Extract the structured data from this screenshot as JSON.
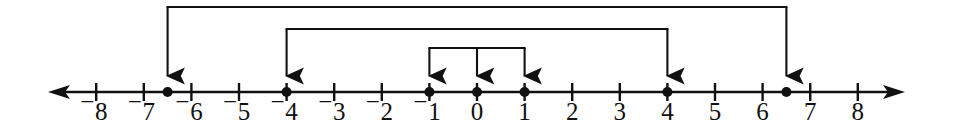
{
  "figure": {
    "background_color": "#ffffff",
    "ink_color": "#111111"
  },
  "chart_data": {
    "type": "line",
    "xlabel": "",
    "ylabel": "",
    "xlim": [
      -8.8,
      8.8
    ],
    "grid": false,
    "legend": false,
    "axis": {
      "orientation": "horizontal",
      "arrow_left": true,
      "arrow_right": true,
      "tick_min": -8,
      "tick_max": 8,
      "tick_step": 1,
      "origin": 0
    },
    "tick_values": [
      -8,
      -7,
      -6,
      -5,
      -4,
      -3,
      -2,
      -1,
      0,
      1,
      2,
      3,
      4,
      5,
      6,
      7,
      8
    ],
    "tick_labels": [
      "⁻8",
      "⁻7",
      "⁻6",
      "⁻5",
      "⁻4",
      "⁻3",
      "⁻2",
      "⁻1",
      "0",
      "1",
      "2",
      "3",
      "4",
      "5",
      "6",
      "7",
      "8"
    ],
    "negative_sign_style": "raised-superscript-minus",
    "points": [
      {
        "label": "point-neg-6-5",
        "value": -6.5,
        "marker": "filled-dot"
      },
      {
        "label": "point-neg-4",
        "value": -4,
        "marker": "filled-dot"
      },
      {
        "label": "point-neg-1",
        "value": -1,
        "marker": "filled-dot"
      },
      {
        "label": "point-0",
        "value": 0,
        "marker": "filled-dot"
      },
      {
        "label": "point-1",
        "value": 1,
        "marker": "filled-dot"
      },
      {
        "label": "point-4",
        "value": 4,
        "marker": "filled-dot"
      },
      {
        "label": "point-6-5",
        "value": 6.5,
        "marker": "filled-dot"
      }
    ],
    "brackets": [
      {
        "name": "outer-bracket",
        "level": 1,
        "span": [
          -6.5,
          6.5
        ],
        "arrow_targets": [
          -6.5,
          6.5
        ],
        "arrow_direction": "down"
      },
      {
        "name": "middle-bracket",
        "level": 2,
        "span": [
          -4,
          4
        ],
        "arrow_targets": [
          -4,
          4
        ],
        "arrow_direction": "down"
      },
      {
        "name": "inner-bracket",
        "level": 3,
        "span": [
          -1,
          1
        ],
        "arrow_targets": [
          -1,
          0,
          1
        ],
        "arrow_direction": "down"
      }
    ]
  },
  "geometry": {
    "axis_y": 92,
    "unit_px": 47.6,
    "origin_px": 477,
    "axis_left_tip": 48,
    "axis_right_tip": 905,
    "tick_half_height": 9,
    "dot_radius": 5,
    "label_baseline_y": 120,
    "bracket_levels_y": [
      7,
      29,
      48
    ]
  }
}
